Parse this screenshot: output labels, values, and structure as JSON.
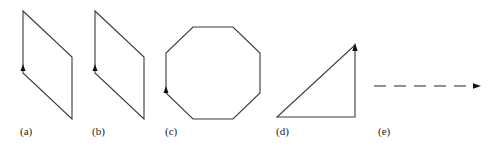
{
  "figure": {
    "panels": [
      {
        "id": "a",
        "label": "(a)",
        "shape": "parallelogram",
        "arrow_direction": "up"
      },
      {
        "id": "b",
        "label": "(b)",
        "shape": "parallelogram",
        "arrow_direction": "up"
      },
      {
        "id": "c",
        "label": "(c)",
        "shape": "octagon",
        "arrow_direction": "up"
      },
      {
        "id": "d",
        "label": "(d)",
        "shape": "right-triangle",
        "arrow_direction": "up"
      },
      {
        "id": "e",
        "label": "(e)",
        "shape": "dashed-arrow",
        "arrow_direction": "right"
      }
    ],
    "stroke_color": "#3a3a3a",
    "background": "#ffffff"
  }
}
